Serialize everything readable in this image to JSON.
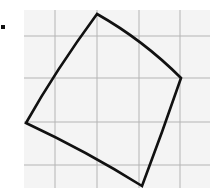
{
  "figure": {
    "bullet_icon": "square-bullet-icon",
    "colors": {
      "grid_background": "#f4f4f4",
      "grid_line": "#b4b4b4",
      "shape_stroke": "#111111",
      "bullet": "#111111"
    },
    "grid": {
      "left": 24,
      "top": 10,
      "right": 210,
      "bottom": 188,
      "vertical_lines": [
        55,
        97,
        139,
        180
      ],
      "horizontal_lines": [
        36,
        78,
        122,
        165
      ]
    },
    "shape": {
      "vertices": [
        {
          "name": "top",
          "x": 97,
          "y": 14
        },
        {
          "name": "right",
          "x": 181,
          "y": 78
        },
        {
          "name": "bottom",
          "x": 142,
          "y": 186
        },
        {
          "name": "left",
          "x": 26,
          "y": 123
        }
      ],
      "stroke_width": 2.6
    }
  }
}
